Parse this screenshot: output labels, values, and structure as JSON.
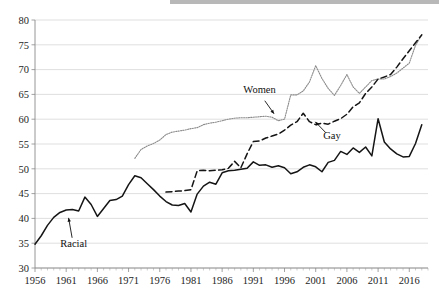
{
  "chart_data": {
    "type": "line",
    "title": "",
    "xlabel": "",
    "ylabel": "",
    "xlim": [
      1956,
      2019
    ],
    "ylim": [
      30,
      80
    ],
    "grid": true,
    "legend_position": "inline-annotations",
    "x_ticks": [
      1956,
      1961,
      1966,
      1971,
      1976,
      1981,
      1986,
      1991,
      1996,
      2001,
      2006,
      2011,
      2016
    ],
    "y_ticks": [
      30,
      35,
      40,
      45,
      50,
      55,
      60,
      65,
      70,
      75,
      80
    ],
    "annotations": [
      {
        "text": "Racial",
        "x": 1962.2,
        "y": 34.3,
        "points_to": {
          "x": 1961.3,
          "y": 40.7
        }
      },
      {
        "text": "Women",
        "x": 1992.0,
        "y": 65.2,
        "points_to": {
          "x": 1994.6,
          "y": 60.6
        }
      },
      {
        "text": "Gay",
        "x": 2003.6,
        "y": 56.0,
        "points_to": {
          "x": 2000.6,
          "y": 59.9
        }
      }
    ],
    "series": [
      {
        "name": "Racial",
        "style": "solid",
        "color": "#151515",
        "x": [
          1956,
          1957,
          1958,
          1959,
          1960,
          1961,
          1962,
          1963,
          1964,
          1965,
          1966,
          1967,
          1968,
          1969,
          1970,
          1971,
          1972,
          1973,
          1974,
          1975,
          1976,
          1977,
          1978,
          1979,
          1980,
          1981,
          1982,
          1983,
          1984,
          1985,
          1986,
          1987,
          1988,
          1989,
          1990,
          1991,
          1992,
          1993,
          1994,
          1995,
          1996,
          1997,
          1998,
          1999,
          2000,
          2001,
          2002,
          2003,
          2004,
          2005,
          2006,
          2007,
          2008,
          2009,
          2010,
          2011,
          2012,
          2013,
          2014,
          2015,
          2016,
          2017,
          2018
        ],
        "values": [
          34.8,
          36.5,
          38.6,
          40.2,
          41.2,
          41.7,
          41.8,
          41.5,
          44.3,
          42.8,
          40.4,
          42.0,
          43.6,
          43.8,
          44.5,
          46.8,
          48.6,
          48.2,
          47.0,
          45.8,
          44.5,
          43.4,
          42.7,
          42.6,
          43.0,
          41.3,
          44.9,
          46.5,
          47.3,
          46.9,
          49.2,
          49.6,
          49.7,
          49.9,
          50.1,
          51.4,
          50.7,
          50.8,
          50.3,
          50.6,
          50.2,
          49.0,
          49.4,
          50.3,
          50.8,
          50.4,
          49.4,
          51.3,
          51.7,
          53.5,
          52.9,
          54.2,
          53.3,
          54.4,
          52.6,
          60.1,
          55.4,
          54.0,
          53.0,
          52.4,
          52.5,
          55.1,
          58.9
        ]
      },
      {
        "name": "Women",
        "style": "dotted",
        "color": "#8c8c8c",
        "x": [
          1972,
          1973,
          1974,
          1975,
          1976,
          1977,
          1978,
          1979,
          1980,
          1981,
          1982,
          1983,
          1984,
          1985,
          1986,
          1987,
          1988,
          1989,
          1990,
          1991,
          1992,
          1993,
          1994,
          1995,
          1996,
          1997,
          1998,
          1999,
          2000,
          2001,
          2002,
          2003,
          2004,
          2005,
          2006,
          2007,
          2008,
          2009,
          2010,
          2011,
          2012,
          2013,
          2014,
          2015,
          2016,
          2017,
          2018
        ],
        "values": [
          52.1,
          53.9,
          54.6,
          55.1,
          55.8,
          56.9,
          57.4,
          57.6,
          57.8,
          58.1,
          58.3,
          58.9,
          59.2,
          59.4,
          59.7,
          60.0,
          60.2,
          60.3,
          60.3,
          60.4,
          60.5,
          60.6,
          60.4,
          59.7,
          60.0,
          64.9,
          64.9,
          65.7,
          67.5,
          70.8,
          68.2,
          66.2,
          64.8,
          66.8,
          69.0,
          66.5,
          65.2,
          66.5,
          67.8,
          68.1,
          68.1,
          68.6,
          69.3,
          70.3,
          71.3,
          74.9,
          77.0
        ]
      },
      {
        "name": "Gay",
        "style": "dashed",
        "color": "#151515",
        "x": [
          1977,
          1978,
          1979,
          1980,
          1981,
          1982,
          1983,
          1984,
          1985,
          1986,
          1987,
          1988,
          1989,
          1990,
          1991,
          1992,
          1993,
          1994,
          1995,
          1996,
          1997,
          1998,
          1999,
          2000,
          2001,
          2002,
          2003,
          2004,
          2005,
          2006,
          2007,
          2008,
          2009,
          2010,
          2011,
          2012,
          2013,
          2014,
          2015,
          2016,
          2017,
          2018
        ],
        "values": [
          45.3,
          45.4,
          45.5,
          45.6,
          45.8,
          49.6,
          49.7,
          49.6,
          49.7,
          49.8,
          50.1,
          51.5,
          50.2,
          53.0,
          55.5,
          55.6,
          56.2,
          56.6,
          57.0,
          57.8,
          58.8,
          59.5,
          61.2,
          59.5,
          58.9,
          59.2,
          59.0,
          59.6,
          60.1,
          61.0,
          62.5,
          63.3,
          65.2,
          66.5,
          68.1,
          68.5,
          69.0,
          70.5,
          72.2,
          73.8,
          75.4,
          77.0
        ]
      }
    ]
  }
}
